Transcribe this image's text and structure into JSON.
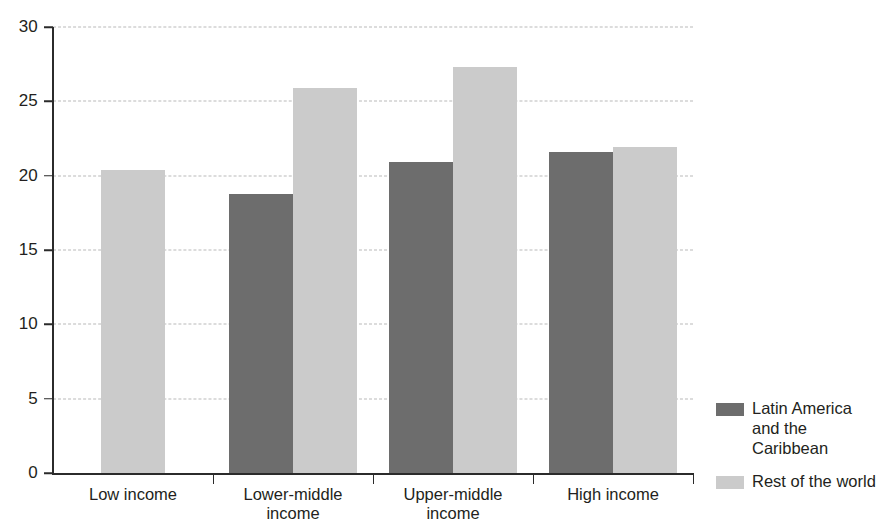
{
  "chart_data": {
    "type": "bar",
    "title": "",
    "subtitle": "",
    "xlabel": "",
    "ylabel": "",
    "categories": [
      "Low income",
      "Lower-middle\nincome",
      "Upper-middle\nincome",
      "High income"
    ],
    "series": [
      {
        "name": "Latin America\nand the Caribbean",
        "color": "#6d6d6d",
        "values": [
          null,
          18.8,
          20.9,
          21.6
        ]
      },
      {
        "name": "Rest of the world",
        "color": "#cbcbcb",
        "values": [
          20.4,
          25.9,
          27.3,
          21.9
        ]
      }
    ],
    "ylim": [
      0,
      30
    ],
    "yticks": [
      0,
      5,
      10,
      15,
      20,
      25,
      30
    ],
    "ytick_labels": [
      "0",
      "5",
      "10",
      "15",
      "20",
      "25",
      "30"
    ],
    "grid": true,
    "grid_axis": "y",
    "grid_style": "dashed",
    "legend_position": "right-bottom",
    "legend": [
      {
        "label": "Latin America\nand the Caribbean",
        "color": "#6d6d6d"
      },
      {
        "label": "Rest of the world",
        "color": "#cbcbcb"
      }
    ],
    "annotations": []
  },
  "axis": {
    "y_labels": [
      "30",
      "25",
      "20",
      "15",
      "10",
      "5",
      "0"
    ],
    "x_labels": [
      "Low income",
      "Lower-middle\nincome",
      "Upper-middle\nincome",
      "High income"
    ]
  },
  "colors": {
    "series_dark": "#6d6d6d",
    "series_light": "#cbcbcb",
    "axis": "#2b2b2b",
    "grid": "#b9b9b9",
    "text": "#231f20",
    "background": "#ffffff"
  }
}
